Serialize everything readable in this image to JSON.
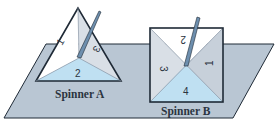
{
  "figure": {
    "colors": {
      "plane": "#b9c6d3",
      "plane_edge": "#1f2a36",
      "sector_white": "#ffffff",
      "sector_light_gray": "#d9dfe6",
      "sector_blue": "#bfe0f2",
      "pointer": "#6e8fae",
      "outline": "#1f2a36"
    },
    "spinner_a": {
      "label": "Spinner A",
      "shape": "triangle",
      "sectors": [
        "1",
        "2",
        "3"
      ]
    },
    "spinner_b": {
      "label": "Spinner B",
      "shape": "square",
      "sectors": [
        "1",
        "2",
        "3",
        "4"
      ]
    }
  }
}
